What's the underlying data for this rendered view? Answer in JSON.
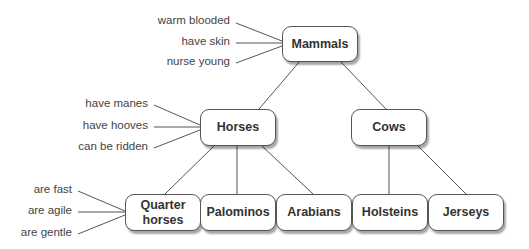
{
  "diagram": {
    "type": "hierarchy",
    "nodes": {
      "mammals": "Mammals",
      "horses": "Horses",
      "cows": "Cows",
      "quarter_horses": "Quarter horses",
      "palominos": "Palominos",
      "arabians": "Arabians",
      "holsteins": "Holsteins",
      "jerseys": "Jerseys"
    },
    "attributes": {
      "mammals": [
        "warm blooded",
        "have skin",
        "nurse young"
      ],
      "horses": [
        "have manes",
        "have hooves",
        "can be ridden"
      ],
      "quarter_horses": [
        "are fast",
        "are agile",
        "are gentle"
      ]
    },
    "edges": [
      [
        "Mammals",
        "Horses"
      ],
      [
        "Mammals",
        "Cows"
      ],
      [
        "Horses",
        "Quarter horses"
      ],
      [
        "Horses",
        "Palominos"
      ],
      [
        "Horses",
        "Arabians"
      ],
      [
        "Cows",
        "Holsteins"
      ],
      [
        "Cows",
        "Jerseys"
      ]
    ]
  }
}
